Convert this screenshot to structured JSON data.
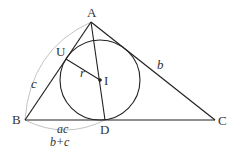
{
  "diagram": {
    "type": "triangle-incircle",
    "points": {
      "A": {
        "label": "A",
        "x": 91,
        "y": 22
      },
      "B": {
        "label": "B",
        "x": 25,
        "y": 120
      },
      "C": {
        "label": "C",
        "x": 215,
        "y": 120
      },
      "D": {
        "label": "D",
        "x": 105,
        "y": 120
      },
      "I": {
        "label": "I",
        "x": 100,
        "y": 80
      },
      "U": {
        "label": "U",
        "x": 66,
        "y": 59
      }
    },
    "incircle": {
      "cx": 100,
      "cy": 80,
      "r": 40
    },
    "labels": {
      "side_b": "b",
      "side_c": "c",
      "radius": "r",
      "bd_numerator": "ac",
      "bd_denominator": "b+c"
    },
    "colors": {
      "line": "#222222",
      "arc": "#bbbbbb",
      "text": "#333333"
    }
  }
}
